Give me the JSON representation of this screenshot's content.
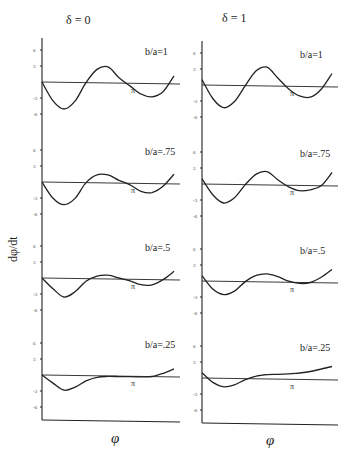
{
  "chart_data": {
    "type": "line",
    "title": "",
    "ylabel": "dφ/dt",
    "xlabel": "φ",
    "ylim": [
      -7,
      7
    ],
    "yticks": [
      6,
      3,
      -3,
      -6
    ],
    "x_marker": "π",
    "columns": [
      {
        "title": "δ = 0",
        "panels": [
          {
            "label": "b/a=1",
            "x": [
              0,
              0.5,
              1,
              1.5,
              2,
              2.5,
              3,
              3.5,
              4,
              4.5,
              5,
              5.5,
              6
            ],
            "y": [
              0,
              -3.5,
              -5,
              -3.5,
              0,
              2.5,
              3,
              1,
              -0.5,
              -2,
              -2.5,
              -1.5,
              1.5
            ]
          },
          {
            "label": "b/a=.75",
            "x": [
              0,
              0.5,
              1,
              1.5,
              2,
              2.5,
              3,
              3.5,
              4,
              4.5,
              5,
              5.5,
              6
            ],
            "y": [
              0,
              -3,
              -4.2,
              -3,
              0,
              1.5,
              1.5,
              0.5,
              -0.3,
              -1.5,
              -1.7,
              -0.5,
              1.8
            ]
          },
          {
            "label": "b/a=.5",
            "x": [
              0,
              0.5,
              1,
              1.5,
              2,
              2.5,
              3,
              3.5,
              4,
              4.5,
              5,
              5.5,
              6
            ],
            "y": [
              0,
              -2,
              -3.5,
              -2.5,
              -0.5,
              0.5,
              0.7,
              0.2,
              -0.3,
              -1,
              -1,
              0,
              1.6
            ]
          },
          {
            "label": "b/a=.25",
            "x": [
              0,
              0.5,
              1,
              1.5,
              2,
              2.5,
              3,
              3.5,
              4,
              4.5,
              5,
              5.5,
              6
            ],
            "y": [
              0,
              -1.5,
              -2.8,
              -2.2,
              -1,
              -0.3,
              -0.1,
              -0.1,
              -0.1,
              -0.1,
              0,
              0.6,
              1.5
            ]
          }
        ]
      },
      {
        "title": "δ = 1",
        "panels": [
          {
            "label": "b/a=1",
            "x": [
              0,
              0.5,
              1,
              1.5,
              2,
              2.5,
              3,
              3.5,
              4,
              4.5,
              5,
              5.5,
              6
            ],
            "y": [
              1,
              -2.5,
              -4.2,
              -3,
              0,
              2.8,
              3.5,
              1.5,
              -0.5,
              -1.8,
              -2,
              -0.5,
              2.5
            ]
          },
          {
            "label": "b/a=.75",
            "x": [
              0,
              0.5,
              1,
              1.5,
              2,
              2.5,
              3,
              3.5,
              4,
              4.5,
              5,
              5.5,
              6
            ],
            "y": [
              1,
              -2,
              -3.5,
              -2.5,
              0,
              2,
              2.5,
              1,
              -0.3,
              -1,
              -0.8,
              0,
              2.5
            ]
          },
          {
            "label": "b/a=.5",
            "x": [
              0,
              0.5,
              1,
              1.5,
              2,
              2.5,
              3,
              3.5,
              4,
              4.5,
              5,
              5.5,
              6
            ],
            "y": [
              1,
              -1.5,
              -2.5,
              -1.8,
              0,
              1.2,
              1.5,
              1,
              0.2,
              -0.2,
              0,
              1,
              2.5
            ]
          },
          {
            "label": "b/a=.25",
            "x": [
              0,
              0.5,
              1,
              1.5,
              2,
              2.5,
              3,
              3.5,
              4,
              4.5,
              5,
              5.5,
              6
            ],
            "y": [
              1,
              -0.8,
              -1.6,
              -1.2,
              -0.2,
              0.5,
              0.8,
              0.9,
              1,
              1.2,
              1.5,
              2,
              2.5
            ]
          }
        ]
      }
    ],
    "grid": false,
    "legend": "none"
  },
  "labels": {
    "col0_title": "δ = 0",
    "col1_title": "δ = 1",
    "ylabel": "dφ/dt",
    "xlabel_left": "φ",
    "xlabel_right": "φ",
    "pi": "π",
    "panels_left": [
      "b/a=1",
      "b/a=.75",
      "b/a=.5",
      "b/a=.25"
    ],
    "panels_right": [
      "b/a=1",
      "b/a=.75",
      "b/a=.5",
      "b/a=.25"
    ],
    "ticks": [
      "6",
      "3",
      "-3",
      "-6"
    ]
  }
}
